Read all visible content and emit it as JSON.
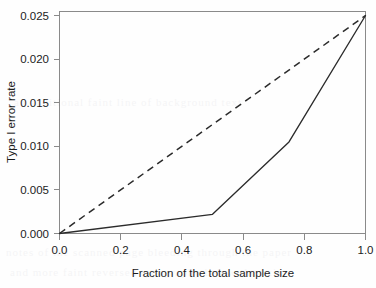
{
  "figure": {
    "background_color": "#fefefe",
    "axis_color": "#8a8a8a",
    "line_color": "#2b2b2b"
  },
  "chart_data": {
    "type": "line",
    "title": "",
    "xlabel": "Fraction of the total sample size",
    "ylabel": "Type I error rate",
    "xlim": [
      0.0,
      1.0
    ],
    "ylim": [
      0.0,
      0.025
    ],
    "grid": false,
    "legend": null,
    "xticks": [
      0.0,
      0.2,
      0.4,
      0.6,
      0.8,
      1.0
    ],
    "xticklabels": [
      "0.0",
      "0.2",
      "0.4",
      "0.6",
      "0.8",
      "1.0"
    ],
    "yticks": [
      0.0,
      0.005,
      0.01,
      0.015,
      0.02,
      0.025
    ],
    "yticklabels": [
      "0.000",
      "0.005",
      "0.010",
      "0.015",
      "0.020",
      "0.025"
    ],
    "series": [
      {
        "name": "solid-curve",
        "style": "solid",
        "x": [
          0.0,
          0.5,
          0.75,
          1.0
        ],
        "values": [
          0.0,
          0.0022,
          0.0105,
          0.025
        ]
      },
      {
        "name": "dashed-reference",
        "style": "dashed",
        "x": [
          0.0,
          1.0
        ],
        "values": [
          0.0,
          0.025
        ]
      }
    ]
  },
  "bleed_text": {
    "rows": [
      "notes of the scanned page bleeding through the paper",
      "and more faint reversed typography below the axis",
      "an additional faint line of background text"
    ]
  }
}
